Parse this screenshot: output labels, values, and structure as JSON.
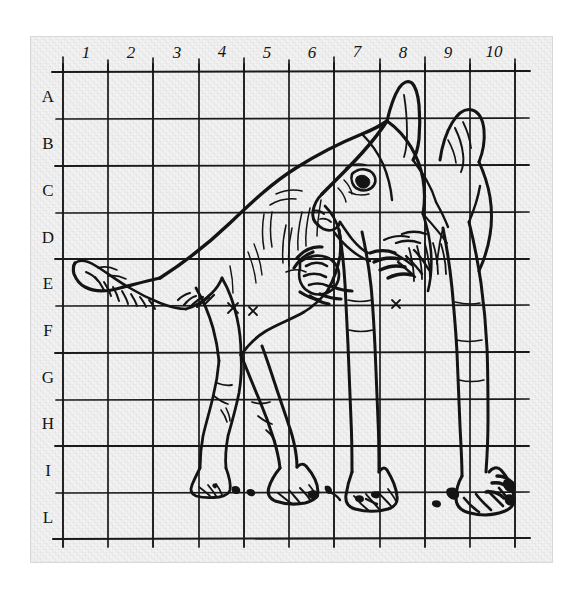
{
  "image": {
    "kind": "scanned-drawing",
    "medium": "pen-and-ink line drawing on gridded paper",
    "subject": "standing dog in profile, head turned toward viewer",
    "background_color": "#ffffff",
    "paper_color": "#eeeeee",
    "ink_color": "#141414",
    "grid_line_color": "#1a1a1a"
  },
  "grid": {
    "label_color": "#141414",
    "column_headers": [
      "1",
      "2",
      "3",
      "4",
      "5",
      "6",
      "7",
      "8",
      "9",
      "10"
    ],
    "row_headers": [
      "A",
      "B",
      "C",
      "D",
      "E",
      "F",
      "G",
      "H",
      "I",
      "L"
    ],
    "columns": 10,
    "rows": 10,
    "origin_x": 63,
    "origin_y": 72,
    "cell_width": 45.2,
    "cell_height": 46.6,
    "header_row_y": 57,
    "header_col_x": 48
  },
  "drawing": {
    "title": "Dog study on grid",
    "strokes_note": "hand-inked contour lines with hatching on tail, chest, legs and ground"
  }
}
